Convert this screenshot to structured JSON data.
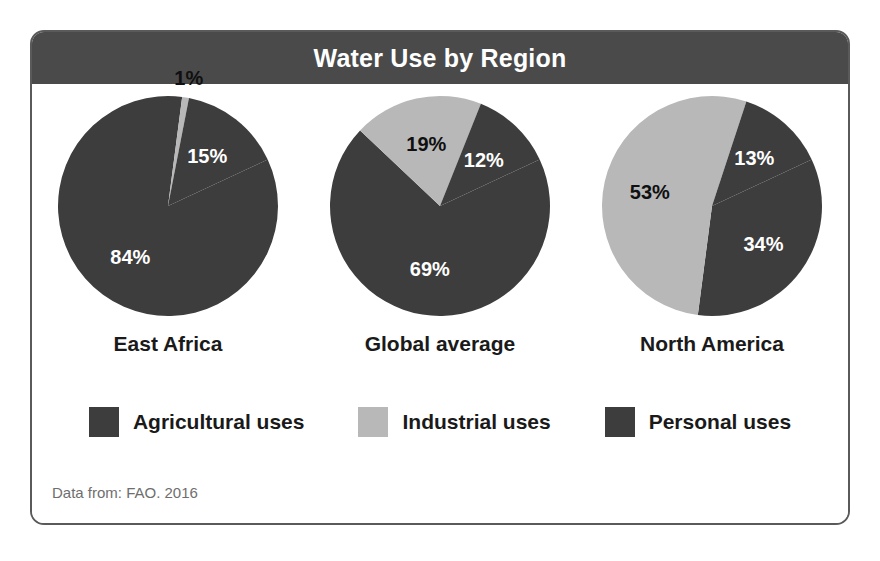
{
  "card": {
    "title": "Water Use by Region",
    "source_note": "Data from: FAO. 2016",
    "border_color": "#5a5a5a",
    "header_bg": "#4a4a4a",
    "header_text_color": "#ffffff",
    "body_bg": "#ffffff"
  },
  "colors": {
    "agricultural": "#3d3d3d",
    "industrial": "#b8b8b8",
    "personal": "#3d3d3d",
    "label_on_dark": "#ffffff",
    "label_on_light": "#101010"
  },
  "legend": {
    "items": [
      {
        "label": "Agricultural uses",
        "color": "#3d3d3d",
        "key": "agricultural"
      },
      {
        "label": "Industrial uses",
        "color": "#b8b8b8",
        "key": "industrial"
      },
      {
        "label": "Personal uses",
        "color": "#3d3d3d",
        "key": "personal"
      }
    ]
  },
  "chart_data": {
    "type": "pie",
    "title": "Water Use by Region",
    "subtitle": "",
    "xlabel": "",
    "ylabel": "",
    "grid": false,
    "legend_position": "bottom",
    "units": "percent",
    "source": "Data from: FAO. 2016",
    "categories": [
      "Agricultural uses",
      "Industrial uses",
      "Personal uses"
    ],
    "charts": [
      {
        "name": "East Africa",
        "slices": [
          {
            "category": "Agricultural uses",
            "value": 84,
            "label": "84%",
            "color": "#3d3d3d",
            "label_color": "on-dark"
          },
          {
            "category": "Industrial uses",
            "value": 1,
            "label": "1%",
            "color": "#b8b8b8",
            "label_color": "outside"
          },
          {
            "category": "Personal uses",
            "value": 15,
            "label": "15%",
            "color": "#3d3d3d",
            "label_color": "on-dark"
          }
        ]
      },
      {
        "name": "Global average",
        "slices": [
          {
            "category": "Agricultural uses",
            "value": 69,
            "label": "69%",
            "color": "#3d3d3d",
            "label_color": "on-dark"
          },
          {
            "category": "Industrial uses",
            "value": 19,
            "label": "19%",
            "color": "#b8b8b8",
            "label_color": "on-light"
          },
          {
            "category": "Personal uses",
            "value": 12,
            "label": "12%",
            "color": "#3d3d3d",
            "label_color": "on-dark"
          }
        ]
      },
      {
        "name": "North America",
        "slices": [
          {
            "category": "Agricultural uses",
            "value": 34,
            "label": "34%",
            "color": "#3d3d3d",
            "label_color": "on-dark"
          },
          {
            "category": "Industrial uses",
            "value": 53,
            "label": "53%",
            "color": "#b8b8b8",
            "label_color": "on-light"
          },
          {
            "category": "Personal uses",
            "value": 13,
            "label": "13%",
            "color": "#3d3d3d",
            "label_color": "on-dark"
          }
        ]
      }
    ]
  },
  "pie_geometry": {
    "cx": 115,
    "cy": 116,
    "r": 110,
    "start_angle_deg": -25,
    "label_radius_factor": 0.58,
    "outside_label_radius_factor": 1.18
  }
}
